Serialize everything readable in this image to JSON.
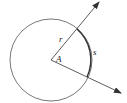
{
  "diagram": {
    "type": "circle-sector-angle",
    "center_label": "A",
    "radius_label": "r",
    "arc_label": "s",
    "colors": {
      "stroke": "#333333",
      "background": "#ffffff"
    },
    "geometry": {
      "center": [
        51,
        60
      ],
      "radius": 41,
      "ray_upper_end": [
        99,
        2
      ],
      "ray_lower_end": [
        121,
        93
      ]
    }
  }
}
